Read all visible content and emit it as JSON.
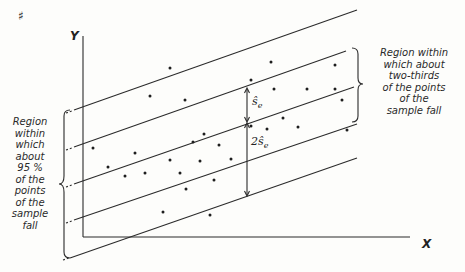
{
  "diagram": {
    "corner_mark": "♯",
    "axes": {
      "y_label": "Y",
      "x_label": "X"
    },
    "annotations": {
      "right_label": [
        "Region within",
        "which about",
        "two-thirds",
        "of the points",
        "of the",
        "sample fall"
      ],
      "left_label": [
        "Region",
        "within",
        "which",
        "about",
        "95 %",
        "of the",
        "points",
        "of the",
        "sample",
        "fall"
      ],
      "se_label": "ŝ",
      "se_sub": "e",
      "two_se_label": "2ŝ",
      "two_se_sub": "e"
    },
    "colors": {
      "line": "#2b2b2b",
      "text": "#2a2a2a",
      "background": "#fdfdfb"
    }
  },
  "chart_data": {
    "type": "scatter",
    "title": "",
    "xlabel": "X",
    "ylabel": "Y",
    "band_lines": [
      {
        "name": "regression + 2se",
        "x1": 74,
        "y1": 110,
        "x2": 357,
        "y2": 10
      },
      {
        "name": "regression + 1se",
        "x1": 74,
        "y1": 147,
        "x2": 346,
        "y2": 51
      },
      {
        "name": "regression line",
        "x1": 74,
        "y1": 184,
        "x2": 354,
        "y2": 87
      },
      {
        "name": "regression - 1se",
        "x1": 74,
        "y1": 220,
        "x2": 357,
        "y2": 124
      },
      {
        "name": "regression - 2se",
        "x1": 70,
        "y1": 258,
        "x2": 357,
        "y2": 158
      }
    ],
    "points": [
      [
        93,
        148
      ],
      [
        108,
        167
      ],
      [
        125,
        176
      ],
      [
        135,
        153
      ],
      [
        145,
        173
      ],
      [
        150,
        96
      ],
      [
        163,
        212
      ],
      [
        170,
        68
      ],
      [
        170,
        160
      ],
      [
        180,
        173
      ],
      [
        185,
        100
      ],
      [
        186,
        189
      ],
      [
        193,
        142
      ],
      [
        200,
        161
      ],
      [
        204,
        134
      ],
      [
        210,
        215
      ],
      [
        214,
        180
      ],
      [
        219,
        145
      ],
      [
        231,
        159
      ],
      [
        251,
        80
      ],
      [
        251,
        126
      ],
      [
        267,
        129
      ],
      [
        271,
        62
      ],
      [
        274,
        89
      ],
      [
        283,
        118
      ],
      [
        298,
        127
      ],
      [
        307,
        89
      ],
      [
        335,
        65
      ],
      [
        335,
        89
      ],
      [
        342,
        100
      ],
      [
        347,
        130
      ]
    ]
  }
}
